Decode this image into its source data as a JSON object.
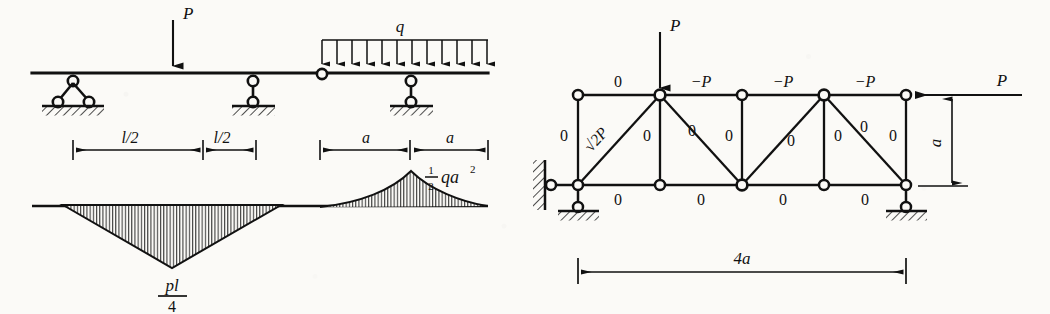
{
  "figure": {
    "kind": "engineering-diagram",
    "ink_color": "#111111",
    "paper_color": "#fbfaf7",
    "hatch_color": "#111111"
  },
  "left_figure": {
    "name": "beam-and-bending-moment-diagram",
    "beam": {
      "point_load_label": "P",
      "distributed_load_label": "q",
      "distributed_load_arrow_count": 12,
      "internal_hinge_count": 1,
      "supports": [
        {
          "id": "support-a",
          "type": "pin-triangle-link"
        },
        {
          "id": "support-b",
          "type": "vertical-link-roller"
        },
        {
          "id": "support-c",
          "type": "vertical-link-roller"
        }
      ]
    },
    "dimensions": [
      {
        "id": "dim-l-half-left",
        "label": "l/2"
      },
      {
        "id": "dim-l-half-right",
        "label": "l/2"
      },
      {
        "id": "dim-a-left",
        "label": "a"
      },
      {
        "id": "dim-a-right",
        "label": "a"
      }
    ],
    "moment_diagram": {
      "negative_peak_label_numerator": "pl",
      "negative_peak_label_denominator": "4",
      "positive_peak_label_fraction_numerator": "1",
      "positive_peak_label_fraction_denominator": "2",
      "positive_peak_label_rest": "qa",
      "positive_peak_label_exponent": "2",
      "hatch_fill": "vertical-lines"
    }
  },
  "right_figure": {
    "name": "plane-truss-member-forces",
    "loads": [
      {
        "id": "load-vertical-P",
        "label": "P",
        "direction": "down"
      },
      {
        "id": "load-horizontal-P",
        "label": "P",
        "direction": "left"
      }
    ],
    "supports": [
      {
        "id": "truss-support-left",
        "type": "pin-two-link-wall-and-ground"
      },
      {
        "id": "truss-support-right",
        "type": "vertical-link-ground"
      }
    ],
    "dimensions": [
      {
        "id": "dim-span",
        "label": "4a"
      },
      {
        "id": "dim-height",
        "label": "a"
      }
    ],
    "member_force_labels": {
      "top_chord": [
        "0",
        "−P",
        "−P",
        "−P"
      ],
      "bottom_chord": [
        "0",
        "0",
        "0",
        "0"
      ],
      "verticals": [
        "0",
        "0",
        "0",
        "0",
        "0"
      ],
      "diagonals": [
        "√2P",
        "0",
        "0",
        "0"
      ],
      "extra_zeros": [
        "0",
        "0",
        "0"
      ]
    },
    "diagonal_label": "√2P",
    "zero_label": "0",
    "neg_P_label": "−P"
  }
}
